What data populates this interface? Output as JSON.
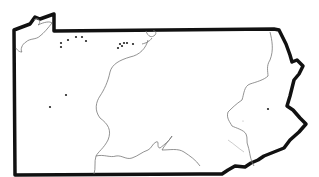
{
  "map": {
    "region": "Pennsylvania outline",
    "colors": {
      "background": "#ffffff",
      "state_border": "#111111",
      "inner_lines": "#777777",
      "dots": "#222222"
    },
    "locations": [
      {
        "x": 61,
        "y": 43
      },
      {
        "x": 61,
        "y": 46
      },
      {
        "x": 68,
        "y": 40
      },
      {
        "x": 76,
        "y": 37
      },
      {
        "x": 82,
        "y": 37
      },
      {
        "x": 86,
        "y": 41
      },
      {
        "x": 118,
        "y": 47
      },
      {
        "x": 120,
        "y": 44
      },
      {
        "x": 123,
        "y": 43
      },
      {
        "x": 125,
        "y": 43
      },
      {
        "x": 127,
        "y": 42
      },
      {
        "x": 133,
        "y": 44
      },
      {
        "x": 66,
        "y": 95
      },
      {
        "x": 50,
        "y": 107
      },
      {
        "x": 268,
        "y": 109
      }
    ]
  }
}
